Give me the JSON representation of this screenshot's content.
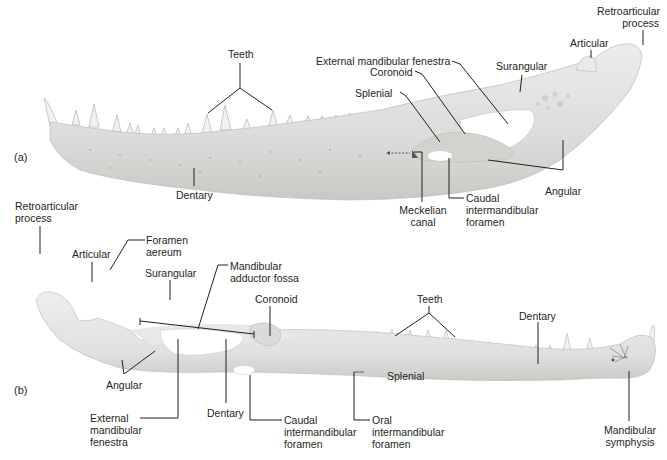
{
  "figure": {
    "panels": [
      {
        "id": "a",
        "tag": "(a)",
        "view": "lateral view of lower jaw",
        "labels": {
          "teeth": "Teeth",
          "dentary": "Dentary",
          "external_mandibular_fenestra": "External mandibular fenestra",
          "coronoid": "Coronoid",
          "splenial": "Splenial",
          "surangular": "Surangular",
          "articular": "Articular",
          "retroarticular_process": "Retroarticular\nprocess",
          "angular": "Angular",
          "meckelian_canal": "Meckelian\ncanal",
          "caudal_intermandibular_foramen": "Caudal\nintermandibular\nforamen"
        }
      },
      {
        "id": "b",
        "tag": "(b)",
        "view": "medial view of lower jaw",
        "labels": {
          "retroarticular_process": "Retroarticular\nprocess",
          "articular": "Articular",
          "foramen_aereum": "Foramen\naereum",
          "surangular": "Surangular",
          "mandibular_adductor_fossa": "Mandibular\nadductor fossa",
          "coronoid": "Coronoid",
          "teeth": "Teeth",
          "dentary_top": "Dentary",
          "angular": "Angular",
          "external_mandibular_fenestra": "External\nmandibular\nfenestra",
          "dentary_bottom": "Dentary",
          "caudal_intermandibular_foramen": "Caudal\nintermandibular\nforamen",
          "splenial": "Splenial",
          "oral_intermandibular_foramen": "Oral\nintermandibular\nforamen",
          "mandibular_symphysis": "Mandibular\nsymphysis"
        }
      }
    ],
    "colors": {
      "bone": "#e6e6e4",
      "bone_shade": "#cfcfcc",
      "bone_dark": "#b9b9b6",
      "leader": "#231f20",
      "text": "#231f20"
    }
  }
}
